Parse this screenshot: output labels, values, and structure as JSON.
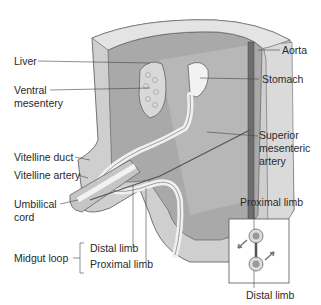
{
  "labels": {
    "liver": "Liver",
    "ventral_mesentery_1": "Ventral",
    "ventral_mesentery_2": "mesentery",
    "aorta": "Aorta",
    "stomach": "Stomach",
    "sma_1": "Superior",
    "sma_2": "mesenteric",
    "sma_3": "artery",
    "vitelline_duct": "Vitelline duct",
    "vitelline_artery": "Vitelline artery",
    "umbilical_1": "Umbilical",
    "umbilical_2": "cord",
    "midgut_loop": "Midgut loop",
    "distal_limb": "Distal limb",
    "proximal_limb": "Proximal limb"
  },
  "inset": {
    "top_label": "Proximal limb",
    "bottom_label": "Distal limb"
  },
  "colors": {
    "wall_outer": "#c8c8c8",
    "wall_inner": "#9a9a9a",
    "cavity": "#b5b5b5",
    "gut": "#eeeeee",
    "aorta": "#6e6e6e",
    "line": "#444444"
  }
}
